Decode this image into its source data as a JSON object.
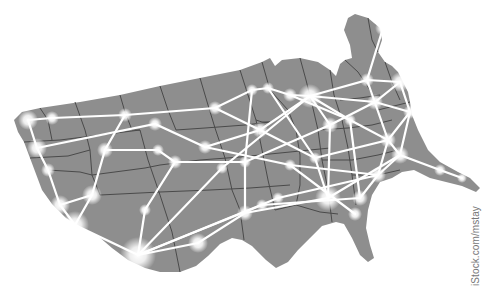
{
  "image": {
    "subject": "Map of the contiguous United States with glowing network connections",
    "credit": "iStock.com/mstay"
  },
  "colors": {
    "background": "#ffffff",
    "land": "#8e8e8e",
    "state_border": "#4a4a4a",
    "network_line": "#ffffff",
    "node_glow": "#ffffff"
  },
  "nodes": [
    {
      "x": 28,
      "y": 120,
      "r": 6
    },
    {
      "x": 52,
      "y": 118,
      "r": 4
    },
    {
      "x": 125,
      "y": 115,
      "r": 4
    },
    {
      "x": 155,
      "y": 124,
      "r": 4
    },
    {
      "x": 37,
      "y": 148,
      "r": 6
    },
    {
      "x": 48,
      "y": 170,
      "r": 4
    },
    {
      "x": 105,
      "y": 150,
      "r": 5
    },
    {
      "x": 158,
      "y": 150,
      "r": 4
    },
    {
      "x": 60,
      "y": 205,
      "r": 6
    },
    {
      "x": 75,
      "y": 225,
      "r": 9
    },
    {
      "x": 92,
      "y": 195,
      "r": 6
    },
    {
      "x": 138,
      "y": 255,
      "r": 12
    },
    {
      "x": 145,
      "y": 210,
      "r": 4
    },
    {
      "x": 175,
      "y": 162,
      "r": 4
    },
    {
      "x": 205,
      "y": 147,
      "r": 4
    },
    {
      "x": 215,
      "y": 108,
      "r": 4
    },
    {
      "x": 252,
      "y": 90,
      "r": 4
    },
    {
      "x": 268,
      "y": 88,
      "r": 4
    },
    {
      "x": 290,
      "y": 95,
      "r": 4
    },
    {
      "x": 310,
      "y": 96,
      "r": 7
    },
    {
      "x": 260,
      "y": 130,
      "r": 5
    },
    {
      "x": 245,
      "y": 162,
      "r": 4
    },
    {
      "x": 222,
      "y": 168,
      "r": 4
    },
    {
      "x": 198,
      "y": 243,
      "r": 6
    },
    {
      "x": 245,
      "y": 213,
      "r": 5
    },
    {
      "x": 262,
      "y": 205,
      "r": 4
    },
    {
      "x": 278,
      "y": 198,
      "r": 4
    },
    {
      "x": 328,
      "y": 198,
      "r": 8
    },
    {
      "x": 355,
      "y": 214,
      "r": 4
    },
    {
      "x": 360,
      "y": 198,
      "r": 5
    },
    {
      "x": 378,
      "y": 175,
      "r": 5
    },
    {
      "x": 388,
      "y": 140,
      "r": 5
    },
    {
      "x": 400,
      "y": 155,
      "r": 5
    },
    {
      "x": 375,
      "y": 102,
      "r": 5
    },
    {
      "x": 367,
      "y": 80,
      "r": 4
    },
    {
      "x": 383,
      "y": 28,
      "r": 5
    },
    {
      "x": 400,
      "y": 82,
      "r": 6
    },
    {
      "x": 330,
      "y": 125,
      "r": 5
    },
    {
      "x": 350,
      "y": 120,
      "r": 4
    },
    {
      "x": 315,
      "y": 158,
      "r": 4
    },
    {
      "x": 290,
      "y": 165,
      "r": 4
    },
    {
      "x": 440,
      "y": 170,
      "r": 4
    },
    {
      "x": 462,
      "y": 178,
      "r": 3
    },
    {
      "x": 410,
      "y": 112,
      "r": 4
    }
  ]
}
